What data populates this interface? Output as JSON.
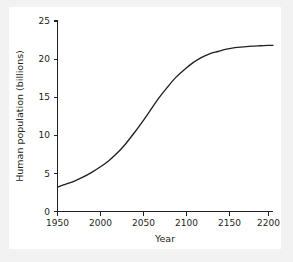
{
  "figure": {
    "background_color": "#f2f2f2",
    "panel_color": "#ffffff",
    "line_color": "#231f20"
  },
  "chart_data": {
    "type": "line",
    "title": "",
    "xlabel": "Year",
    "ylabel": "Human population (billions)",
    "xlim": [
      1950,
      2205
    ],
    "ylim": [
      0,
      25
    ],
    "xticks": [
      1950,
      2000,
      2050,
      2100,
      2150,
      2200
    ],
    "yticks": [
      0,
      5,
      10,
      15,
      20,
      25
    ],
    "xtick_labels": [
      "1950",
      "2000",
      "2050",
      "2100",
      "2150",
      "2200"
    ],
    "ytick_labels": [
      "0",
      "5",
      "10",
      "15",
      "20",
      "25"
    ],
    "grid": false,
    "legend": null,
    "series": [
      {
        "name": "Human population",
        "x": [
          1950,
          1960,
          1970,
          1980,
          1990,
          2000,
          2010,
          2020,
          2030,
          2040,
          2050,
          2060,
          2070,
          2080,
          2090,
          2100,
          2110,
          2120,
          2130,
          2140,
          2150,
          2160,
          2170,
          2180,
          2190,
          2200,
          2205
        ],
        "values": [
          3.2,
          3.6,
          4.0,
          4.5,
          5.1,
          5.8,
          6.6,
          7.6,
          8.8,
          10.2,
          11.7,
          13.3,
          14.9,
          16.3,
          17.6,
          18.6,
          19.5,
          20.2,
          20.7,
          21.0,
          21.3,
          21.5,
          21.6,
          21.7,
          21.75,
          21.8,
          21.8
        ]
      }
    ]
  },
  "axis": {
    "x_title": "Year",
    "y_title": "Human population (billions)"
  }
}
